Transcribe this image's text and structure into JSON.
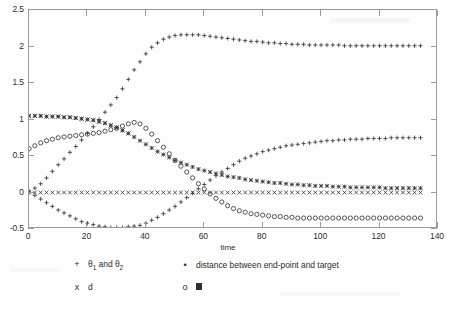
{
  "chart_data": {
    "type": "scatter",
    "title": "",
    "xlabel": "time",
    "ylabel": "",
    "xlim": [
      0,
      140
    ],
    "ylim": [
      -0.5,
      2.5
    ],
    "xticks": [
      0,
      20,
      40,
      60,
      80,
      100,
      120,
      140
    ],
    "yticks": [
      -0.5,
      0,
      0.5,
      1,
      1.5,
      2,
      2.5
    ],
    "grid": false,
    "legend_position": "below-axes",
    "series": [
      {
        "name": "theta_1",
        "legend_label": "θ1 and θ2",
        "marker": "+",
        "x": [
          0,
          2,
          4,
          6,
          8,
          10,
          12,
          14,
          16,
          18,
          20,
          22,
          24,
          26,
          28,
          30,
          32,
          34,
          36,
          38,
          40,
          42,
          44,
          46,
          48,
          50,
          52,
          54,
          56,
          58,
          60,
          62,
          64,
          66,
          68,
          70,
          72,
          74,
          76,
          78,
          80,
          82,
          84,
          86,
          88,
          90,
          92,
          94,
          96,
          98,
          100,
          102,
          104,
          106,
          108,
          110,
          112,
          114,
          116,
          118,
          120,
          122,
          124,
          126,
          128,
          130,
          132,
          134
        ],
        "y": [
          0.02,
          0.06,
          0.12,
          0.2,
          0.29,
          0.38,
          0.46,
          0.55,
          0.63,
          0.72,
          0.81,
          0.9,
          1.0,
          1.1,
          1.2,
          1.3,
          1.42,
          1.55,
          1.68,
          1.79,
          1.9,
          1.99,
          2.05,
          2.1,
          2.13,
          2.15,
          2.16,
          2.16,
          2.16,
          2.16,
          2.15,
          2.14,
          2.13,
          2.12,
          2.11,
          2.1,
          2.09,
          2.08,
          2.07,
          2.07,
          2.06,
          2.05,
          2.05,
          2.04,
          2.04,
          2.03,
          2.03,
          2.03,
          2.02,
          2.02,
          2.02,
          2.02,
          2.02,
          2.02,
          2.01,
          2.01,
          2.01,
          2.01,
          2.01,
          2.01,
          2.01,
          2.01,
          2.01,
          2.01,
          2.01,
          2.01,
          2.01,
          2.01
        ]
      },
      {
        "name": "theta_2",
        "legend_label": "θ1 and θ2",
        "marker": "+",
        "x": [
          0,
          2,
          4,
          6,
          8,
          10,
          12,
          14,
          16,
          18,
          20,
          22,
          24,
          26,
          28,
          30,
          32,
          34,
          36,
          38,
          40,
          42,
          44,
          46,
          48,
          50,
          52,
          54,
          56,
          58,
          60,
          62,
          64,
          66,
          68,
          70,
          72,
          74,
          76,
          78,
          80,
          82,
          84,
          86,
          88,
          90,
          92,
          94,
          96,
          98,
          100,
          102,
          104,
          106,
          108,
          110,
          112,
          114,
          116,
          118,
          120,
          122,
          124,
          126,
          128,
          130,
          132,
          134
        ],
        "y": [
          0.0,
          -0.04,
          -0.09,
          -0.14,
          -0.19,
          -0.24,
          -0.28,
          -0.32,
          -0.36,
          -0.4,
          -0.42,
          -0.44,
          -0.46,
          -0.47,
          -0.48,
          -0.48,
          -0.48,
          -0.47,
          -0.46,
          -0.45,
          -0.42,
          -0.38,
          -0.34,
          -0.29,
          -0.24,
          -0.19,
          -0.13,
          -0.07,
          -0.01,
          0.05,
          0.11,
          0.17,
          0.23,
          0.28,
          0.33,
          0.38,
          0.43,
          0.47,
          0.5,
          0.53,
          0.56,
          0.58,
          0.6,
          0.62,
          0.64,
          0.65,
          0.66,
          0.67,
          0.68,
          0.69,
          0.7,
          0.71,
          0.71,
          0.72,
          0.72,
          0.73,
          0.73,
          0.73,
          0.74,
          0.74,
          0.74,
          0.74,
          0.75,
          0.75,
          0.75,
          0.75,
          0.75,
          0.75
        ]
      },
      {
        "name": "distance-between-end-point-and-target",
        "legend_label": "distance between end-point and target",
        "marker": "*",
        "x": [
          0,
          2,
          4,
          6,
          8,
          10,
          12,
          14,
          16,
          18,
          20,
          22,
          24,
          26,
          28,
          30,
          32,
          34,
          36,
          38,
          40,
          42,
          44,
          46,
          48,
          50,
          52,
          54,
          56,
          58,
          60,
          62,
          64,
          66,
          68,
          70,
          72,
          74,
          76,
          78,
          80,
          82,
          84,
          86,
          88,
          90,
          92,
          94,
          96,
          98,
          100,
          102,
          104,
          106,
          108,
          110,
          112,
          114,
          116,
          118,
          120,
          122,
          124,
          126,
          128,
          130,
          132,
          134
        ],
        "y": [
          1.05,
          1.05,
          1.05,
          1.04,
          1.04,
          1.04,
          1.03,
          1.03,
          1.02,
          1.01,
          1.0,
          0.99,
          0.97,
          0.95,
          0.92,
          0.89,
          0.85,
          0.81,
          0.76,
          0.71,
          0.66,
          0.61,
          0.56,
          0.52,
          0.48,
          0.44,
          0.41,
          0.38,
          0.35,
          0.32,
          0.3,
          0.28,
          0.26,
          0.24,
          0.22,
          0.21,
          0.2,
          0.18,
          0.17,
          0.16,
          0.15,
          0.14,
          0.13,
          0.13,
          0.12,
          0.11,
          0.11,
          0.1,
          0.1,
          0.09,
          0.09,
          0.09,
          0.08,
          0.08,
          0.08,
          0.07,
          0.07,
          0.07,
          0.07,
          0.07,
          0.07,
          0.06,
          0.06,
          0.06,
          0.06,
          0.06,
          0.06,
          0.06
        ]
      },
      {
        "name": "d",
        "legend_label": "d",
        "marker": "x",
        "x": [
          0,
          2,
          4,
          6,
          8,
          10,
          12,
          14,
          16,
          18,
          20,
          22,
          24,
          26,
          28,
          30,
          32,
          34,
          36,
          38,
          40,
          42,
          44,
          46,
          48,
          50,
          52,
          54,
          56,
          58,
          60,
          62,
          64,
          66,
          68,
          70,
          72,
          74,
          76,
          78,
          80,
          82,
          84,
          86,
          88,
          90,
          92,
          94,
          96,
          98,
          100,
          102,
          104,
          106,
          108,
          110,
          112,
          114,
          116,
          118,
          120,
          122,
          124,
          126,
          128,
          130,
          132,
          134
        ],
        "y": [
          0.0,
          0.0,
          0.0,
          0.0,
          0.0,
          0.0,
          0.0,
          0.0,
          0.0,
          0.0,
          0.0,
          0.0,
          0.0,
          0.0,
          0.0,
          0.0,
          0.0,
          0.0,
          0.0,
          0.0,
          0.0,
          0.0,
          0.0,
          0.0,
          0.0,
          0.0,
          0.0,
          0.0,
          0.0,
          0.0,
          0.0,
          0.0,
          0.0,
          0.0,
          0.0,
          0.0,
          0.0,
          0.0,
          0.0,
          0.0,
          0.0,
          0.0,
          0.0,
          0.0,
          0.0,
          0.0,
          0.0,
          0.0,
          0.0,
          0.0,
          0.0,
          0.0,
          0.0,
          0.0,
          0.0,
          0.0,
          0.0,
          0.0,
          0.0,
          0.0,
          0.0,
          0.0,
          0.0,
          0.0,
          0.0,
          0.0,
          0.0,
          0.0
        ]
      },
      {
        "name": "d-upper-x-overlay",
        "legend_label": "d",
        "marker": "x",
        "x": [
          0,
          2,
          4,
          6,
          8,
          10,
          12,
          14,
          16,
          18,
          20,
          22,
          24,
          26,
          28,
          30,
          32,
          34
        ],
        "y": [
          1.05,
          1.05,
          1.05,
          1.04,
          1.04,
          1.04,
          1.03,
          1.03,
          1.02,
          1.01,
          1.0,
          0.99,
          0.97,
          0.95,
          0.92,
          0.89,
          0.85,
          0.81
        ]
      },
      {
        "name": "block-series",
        "legend_label": "■",
        "marker": "o",
        "x": [
          0,
          2,
          4,
          6,
          8,
          10,
          12,
          14,
          16,
          18,
          20,
          22,
          24,
          26,
          28,
          30,
          32,
          34,
          36,
          38,
          40,
          42,
          44,
          46,
          48,
          50,
          52,
          54,
          56,
          58,
          60,
          62,
          64,
          66,
          68,
          70,
          72,
          74,
          76,
          78,
          80,
          82,
          84,
          86,
          88,
          90,
          92,
          94,
          96,
          98,
          100,
          102,
          104,
          106,
          108,
          110,
          112,
          114,
          116,
          118,
          120,
          122,
          124,
          126,
          128,
          130,
          132,
          134
        ],
        "y": [
          0.6,
          0.64,
          0.68,
          0.71,
          0.73,
          0.75,
          0.76,
          0.77,
          0.78,
          0.79,
          0.8,
          0.81,
          0.82,
          0.84,
          0.86,
          0.88,
          0.91,
          0.94,
          0.96,
          0.94,
          0.88,
          0.8,
          0.71,
          0.62,
          0.53,
          0.44,
          0.36,
          0.28,
          0.2,
          0.12,
          0.05,
          -0.02,
          -0.08,
          -0.13,
          -0.18,
          -0.22,
          -0.25,
          -0.27,
          -0.29,
          -0.3,
          -0.31,
          -0.32,
          -0.33,
          -0.33,
          -0.34,
          -0.34,
          -0.35,
          -0.35,
          -0.35,
          -0.35,
          -0.35,
          -0.35,
          -0.35,
          -0.35,
          -0.35,
          -0.35,
          -0.35,
          -0.35,
          -0.35,
          -0.35,
          -0.35,
          -0.35,
          -0.35,
          -0.35,
          -0.35,
          -0.35,
          -0.35,
          -0.35
        ]
      }
    ]
  },
  "axes": {
    "xlabel": "time",
    "xtick_labels": [
      "0",
      "20",
      "40",
      "60",
      "80",
      "100",
      "120",
      "140"
    ],
    "ytick_labels": [
      "-0.5",
      "0",
      "0.5",
      "1",
      "1.5",
      "2",
      "2.5"
    ]
  },
  "legend": {
    "rows": [
      {
        "entries": [
          {
            "marker": "+",
            "label": "θ1 and θ2",
            "label_base": "θ",
            "sub1": "1",
            "mid": " and ",
            "label_base2": "θ",
            "sub2": "2"
          },
          {
            "marker": "∗",
            "label": "distance between end-point and target"
          }
        ]
      },
      {
        "entries": [
          {
            "marker": "x",
            "label": "d"
          },
          {
            "marker": "o",
            "label": "■"
          }
        ]
      }
    ]
  },
  "colors": {
    "marker": "#2e2e2e",
    "axis": "#9a9a9a",
    "text": "#2e2e2e",
    "background": "#fdfdfd"
  }
}
